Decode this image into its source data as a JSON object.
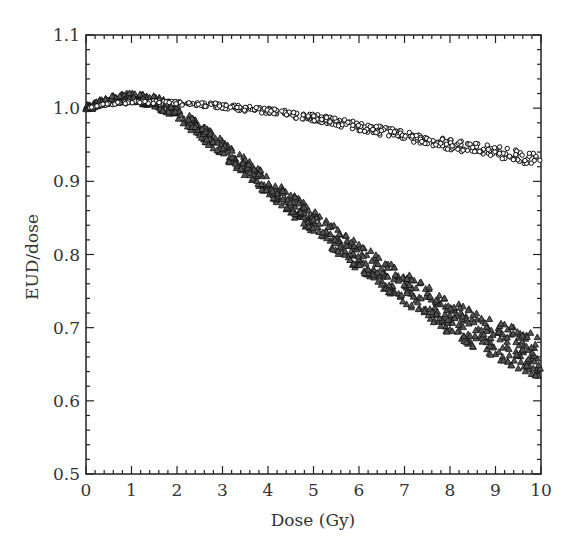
{
  "chart_data": {
    "type": "scatter",
    "title": "",
    "xlabel": "Dose (Gy)",
    "ylabel": "EUD/dose",
    "xlim": [
      0,
      10
    ],
    "ylim": [
      0.5,
      1.1
    ],
    "x_ticks": [
      "0",
      "1",
      "2",
      "3",
      "4",
      "5",
      "6",
      "7",
      "8",
      "9",
      "10"
    ],
    "y_ticks": [
      "0.5",
      "0.6",
      "0.7",
      "0.8",
      "0.9",
      "1.0",
      "1.1"
    ],
    "grid": false,
    "legend": null,
    "series": [
      {
        "name": "circles",
        "marker": "circle",
        "x": [
          0,
          0.5,
          1,
          1.5,
          2,
          3,
          4,
          5,
          6,
          7,
          8,
          9,
          10
        ],
        "values": [
          1.0,
          1.006,
          1.008,
          1.008,
          1.007,
          1.003,
          0.996,
          0.987,
          0.975,
          0.962,
          0.95,
          0.94,
          0.928
        ]
      },
      {
        "name": "triangles",
        "marker": "triangle",
        "x": [
          0,
          0.5,
          1,
          1.5,
          2,
          2.5,
          3,
          3.5,
          4,
          4.5,
          5,
          5.5,
          6,
          6.5,
          7,
          7.5,
          8,
          8.5,
          9,
          9.5,
          10
        ],
        "values": [
          1.0,
          1.012,
          1.015,
          1.01,
          0.995,
          0.97,
          0.945,
          0.92,
          0.895,
          0.87,
          0.845,
          0.82,
          0.797,
          0.775,
          0.755,
          0.735,
          0.715,
          0.698,
          0.685,
          0.672,
          0.66
        ]
      }
    ]
  }
}
